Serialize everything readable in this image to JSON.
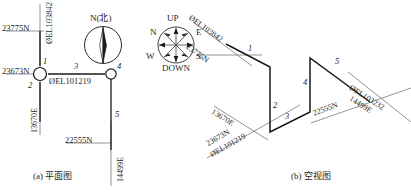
{
  "figure": {
    "panel_a": {
      "caption": "(a) 平面图",
      "compass": {
        "label": "N(北)",
        "type": "north-arrow"
      },
      "coordinate_labels": {
        "north_top": "23775N",
        "north_mid": "23673N",
        "north_bottom": "22555N",
        "east_left": "13670E",
        "east_right": "14499E",
        "el_top": "ØEL103842",
        "el_node": "ØEL101219"
      },
      "segment_numbers": [
        "1",
        "2",
        "3",
        "4",
        "5"
      ]
    },
    "panel_b": {
      "caption": "(b) 空视图",
      "compass": {
        "up": "UP",
        "down": "DOWN",
        "north": "N",
        "south": "S",
        "east": "E",
        "west": "W",
        "type": "3d-orientation-rose"
      },
      "coordinate_labels": {
        "el_top": "ØEL103842",
        "north_top": "23775N",
        "east_left": "13670E",
        "north_left": "23673N",
        "el_left": "ØEL101219",
        "north_right": "22555N",
        "el_right": "ØEL103232",
        "east_right": "14499E"
      },
      "segment_numbers": [
        "1",
        "2",
        "3",
        "4",
        "5"
      ]
    },
    "colors": {
      "line": "#1a1a1a",
      "thin_line": "#6a6a6a",
      "background": "#ffffff"
    }
  }
}
